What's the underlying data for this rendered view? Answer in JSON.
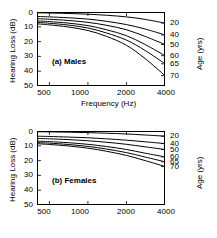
{
  "figure": {
    "xlabel": "Frequency (Hz)",
    "ylabel": "Hearing Loss (dB)",
    "rlabel": "Age (yrs)"
  },
  "axes": {
    "x_ticks": [
      "500",
      "1000",
      "2000",
      "4000"
    ],
    "x_tick_values": [
      500,
      1000,
      2000,
      4000
    ],
    "y_ticks": [
      "0",
      "10",
      "20",
      "30",
      "40",
      "50"
    ],
    "y_tick_values": [
      0,
      10,
      20,
      30,
      40,
      50
    ],
    "age_ticks": [
      "20",
      "40",
      "50",
      "60",
      "65",
      "70"
    ],
    "xlim": [
      400,
      4000
    ],
    "ylim": [
      50,
      0
    ],
    "xscale": "log",
    "grid": false
  },
  "panels": [
    {
      "key": "a",
      "label": "(a)  Males"
    },
    {
      "key": "b",
      "label": "(b)  Females"
    }
  ],
  "chart_data": [
    {
      "type": "line",
      "title": "(a)  Males",
      "xlabel": "Frequency (Hz)",
      "ylabel": "Hearing Loss (dB)",
      "rlabel": "Age (yrs)",
      "xscale": "log",
      "xlim": [
        400,
        4000
      ],
      "ylim": [
        50,
        0
      ],
      "grid": false,
      "legend": "right-axis-age-labels",
      "x": [
        400,
        500,
        700,
        1000,
        1400,
        2000,
        2800,
        4000
      ],
      "series": [
        {
          "name": "20",
          "values": [
            0.5,
            0.7,
            1.0,
            1.5,
            2.2,
            3.3,
            5.0,
            7.5
          ]
        },
        {
          "name": "40",
          "values": [
            3.0,
            3.3,
            3.9,
            4.8,
            6.3,
            8.5,
            11.5,
            15.5
          ]
        },
        {
          "name": "50",
          "values": [
            4.5,
            4.9,
            5.7,
            7.0,
            9.0,
            12.0,
            16.5,
            22.0
          ]
        },
        {
          "name": "60",
          "values": [
            6.0,
            6.5,
            7.5,
            9.2,
            12.0,
            16.0,
            22.0,
            29.5
          ]
        },
        {
          "name": "65",
          "values": [
            7.0,
            7.6,
            8.8,
            10.8,
            14.2,
            19.0,
            26.0,
            35.0
          ]
        },
        {
          "name": "70",
          "values": [
            8.0,
            8.7,
            10.1,
            12.5,
            16.5,
            22.5,
            31.5,
            43.0
          ]
        }
      ]
    },
    {
      "type": "line",
      "title": "(b)  Females",
      "xlabel": "Frequency (Hz)",
      "ylabel": "Hearing Loss (dB)",
      "rlabel": "Age (yrs)",
      "xscale": "log",
      "xlim": [
        400,
        4000
      ],
      "ylim": [
        50,
        0
      ],
      "grid": false,
      "legend": "right-axis-age-labels",
      "x": [
        400,
        500,
        700,
        1000,
        1400,
        2000,
        2800,
        4000
      ],
      "series": [
        {
          "name": "20",
          "values": [
            0.5,
            0.6,
            0.8,
            1.1,
            1.5,
            2.0,
            2.7,
            3.5
          ]
        },
        {
          "name": "40",
          "values": [
            3.5,
            3.7,
            4.1,
            4.6,
            5.3,
            6.2,
            7.3,
            8.5
          ]
        },
        {
          "name": "50",
          "values": [
            5.0,
            5.3,
            5.8,
            6.6,
            7.6,
            9.0,
            10.7,
            12.5
          ]
        },
        {
          "name": "60",
          "values": [
            6.8,
            7.2,
            7.9,
            9.0,
            10.5,
            12.5,
            15.0,
            17.5
          ]
        },
        {
          "name": "65",
          "values": [
            7.8,
            8.2,
            9.1,
            10.4,
            12.2,
            14.6,
            17.6,
            20.8
          ]
        },
        {
          "name": "70",
          "values": [
            8.6,
            9.1,
            10.1,
            11.6,
            13.7,
            16.5,
            20.0,
            24.0
          ]
        }
      ]
    }
  ]
}
